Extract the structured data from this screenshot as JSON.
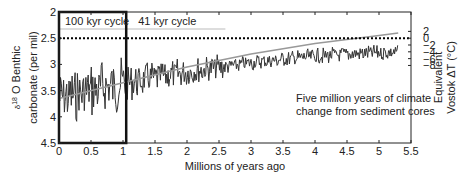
{
  "chart_data": {
    "type": "line",
    "title": "",
    "annotation": [
      "Five million years of climate",
      "change from sediment cores"
    ],
    "xlabel": "Millions of years ago",
    "ylabel_left": [
      "δ18 O Benthic",
      "carbonate (per mil)"
    ],
    "ylabel_right": [
      "Equivalent",
      "Vostok ΔT (°C)"
    ],
    "xlim": [
      0,
      5.5
    ],
    "ylim_left": [
      4.5,
      2
    ],
    "ylim_right": [
      -9.5,
      2.5
    ],
    "x_ticks": [
      "0",
      "0.5",
      "1",
      "1.5",
      "2",
      "2.5",
      "3",
      "3.5",
      "4",
      "4.5",
      "5",
      "5.5"
    ],
    "y_ticks_left": [
      "2",
      "2.5",
      "3",
      "3.5",
      "4",
      "4.5"
    ],
    "y_ticks_right": [
      "2",
      "0",
      "-2",
      "-4",
      "-6",
      "-8"
    ],
    "regions": [
      {
        "label": "100 kyr cycle",
        "x_start": 0,
        "x_end": 1.05
      },
      {
        "label": "41 kyr cycle",
        "x_start": 1.05,
        "x_end": 2.6
      }
    ],
    "reference_line": {
      "y_left": 2.5,
      "y_right": 0,
      "style": "dotted"
    },
    "series": [
      {
        "name": "δ18O record",
        "color": "#333333",
        "note": "oscillating record from ~3.9 (0 Ma, amplitude ~±0.5) to ~2.4 (5.3 Ma, amplitude ~±0.15)"
      },
      {
        "name": "trend",
        "color": "#999999",
        "x": [
          0,
          1,
          2,
          3,
          4,
          5,
          5.3
        ],
        "y": [
          3.65,
          3.35,
          3.05,
          2.8,
          2.6,
          2.45,
          2.4
        ]
      }
    ],
    "grid": false,
    "legend": "none"
  }
}
